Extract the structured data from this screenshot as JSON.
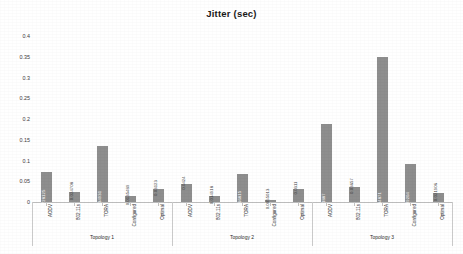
{
  "chart_data": {
    "type": "bar",
    "title": "Jitter (sec)",
    "xlabel": "",
    "ylabel": "",
    "ylim": [
      0,
      0.4
    ],
    "ytick_values": [
      0,
      0.05,
      0.1,
      0.15,
      0.2,
      0.25,
      0.3,
      0.35,
      0.4
    ],
    "ytick_labels": [
      "0",
      "0.05",
      "0.1",
      "0.15",
      "0.2",
      "0.25",
      "0.3",
      "0.35",
      "0.4"
    ],
    "grid": false,
    "legend": "none",
    "bar_color": "#8e8e8e",
    "categories": [
      "AODV",
      "802.11s",
      "TORA",
      "Configured",
      "Optimal"
    ],
    "groups": [
      {
        "name": "Topology 1",
        "bars": [
          {
            "category": "AODV",
            "value": 0.0728,
            "label": "0.0728125"
          },
          {
            "category": "802.11s",
            "value": 0.0247,
            "label": "0.024708"
          },
          {
            "category": "TORA",
            "value": 0.1349,
            "label": "0.134931"
          },
          {
            "category": "Configured",
            "value": 0.0135,
            "label": "0.0135489"
          },
          {
            "category": "Optimal",
            "value": 0.0312,
            "label": "0.03123"
          }
        ]
      },
      {
        "name": "Topology 2",
        "bars": [
          {
            "category": "AODV",
            "value": 0.0424,
            "label": "0.0424"
          },
          {
            "category": "802.11s",
            "value": 0.0149,
            "label": "0.014918"
          },
          {
            "category": "TORA",
            "value": 0.0668,
            "label": "0.066815"
          },
          {
            "category": "Configured",
            "value": 0.0055,
            "label": "0.0055013"
          },
          {
            "category": "Optimal",
            "value": 0.0311,
            "label": "0.0311"
          }
        ]
      },
      {
        "name": "Topology 3",
        "bars": [
          {
            "category": "AODV",
            "value": 0.1887,
            "label": "0.1887"
          },
          {
            "category": "802.11s",
            "value": 0.0366,
            "label": "0.03657"
          },
          {
            "category": "TORA",
            "value": 0.3487,
            "label": "0.34871"
          },
          {
            "category": "Configured",
            "value": 0.092,
            "label": "0.09204"
          },
          {
            "category": "Optimal",
            "value": 0.0219,
            "label": "0.021906"
          }
        ]
      }
    ]
  }
}
